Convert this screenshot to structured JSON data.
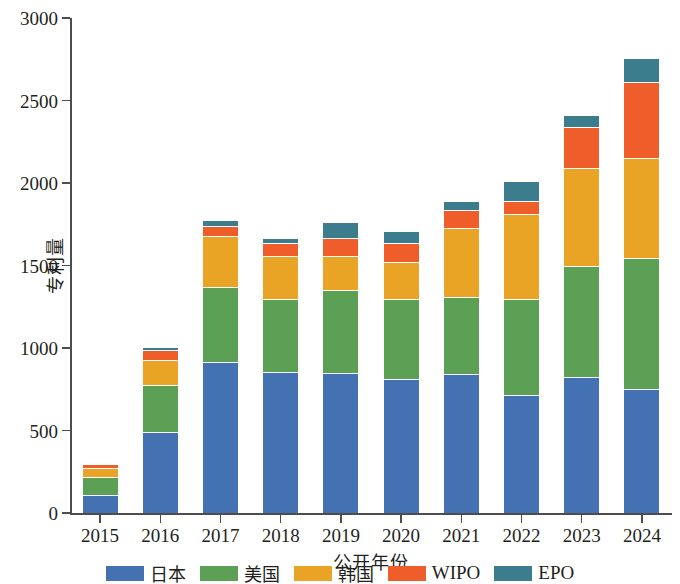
{
  "chart_data": {
    "type": "bar",
    "subtype": "stacked-bar",
    "title": "",
    "xlabel": "公开年份",
    "ylabel": "专利量",
    "categories": [
      "2015",
      "2016",
      "2017",
      "2018",
      "2019",
      "2020",
      "2021",
      "2022",
      "2023",
      "2024"
    ],
    "ylim": [
      0,
      3000
    ],
    "yticks": [
      0,
      500,
      1000,
      1500,
      2000,
      2500,
      3000
    ],
    "ytick_labels": [
      "0",
      "500",
      "1000",
      "1500",
      "2000",
      "2500",
      "3000"
    ],
    "grid": false,
    "legend_position": "bottom",
    "stacked": true,
    "series": [
      {
        "name": "日本",
        "color": "#4471b2",
        "values": [
          110,
          490,
          915,
          855,
          850,
          810,
          845,
          715,
          825,
          750
        ]
      },
      {
        "name": "美国",
        "color": "#5ba054",
        "values": [
          110,
          285,
          455,
          445,
          500,
          490,
          465,
          585,
          675,
          795
        ]
      },
      {
        "name": "韩国",
        "color": "#e9a426",
        "values": [
          50,
          150,
          310,
          255,
          205,
          220,
          415,
          510,
          590,
          605
        ]
      },
      {
        "name": "WIPO",
        "color": "#ef5d2b",
        "values": [
          25,
          60,
          60,
          80,
          110,
          115,
          110,
          80,
          250,
          460
        ]
      },
      {
        "name": "EPO",
        "color": "#3b7d8c",
        "values": [
          10,
          20,
          35,
          30,
          100,
          75,
          55,
          120,
          70,
          150
        ]
      }
    ],
    "totals": [
      305,
      1005,
      1775,
      1665,
      1765,
      1710,
      1890,
      2010,
      2410,
      2760
    ]
  },
  "legend": {
    "items": [
      {
        "label": "日本",
        "color": "#4471b2",
        "cjk": true
      },
      {
        "label": "美国",
        "color": "#5ba054",
        "cjk": true
      },
      {
        "label": "韩国",
        "color": "#e9a426",
        "cjk": true
      },
      {
        "label": "WIPO",
        "color": "#ef5d2b",
        "cjk": false
      },
      {
        "label": "EPO",
        "color": "#3b7d8c",
        "cjk": false
      }
    ]
  },
  "axes": {
    "y_title": "专利量",
    "x_title": "公开年份"
  }
}
